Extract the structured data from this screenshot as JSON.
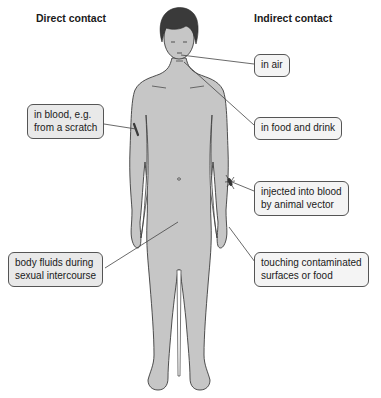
{
  "headings": {
    "direct": "Direct contact",
    "indirect": "Indirect contact"
  },
  "labels": {
    "in_air": {
      "lines": [
        "in air"
      ]
    },
    "food_drink": {
      "lines": [
        "in food and drink"
      ]
    },
    "blood_scratch": {
      "lines": [
        "in blood, e.g.",
        "from a scratch"
      ]
    },
    "animal_vector": {
      "lines": [
        "injected into blood",
        "by animal vector"
      ]
    },
    "touching": {
      "lines": [
        "touching contaminated",
        "surfaces or food"
      ]
    },
    "body_fluids": {
      "lines": [
        "body fluids during",
        "sexual intercourse"
      ]
    }
  },
  "colors": {
    "skin": "#c6c6c6",
    "outline": "#3c3c3c",
    "hair": "#3a3a3a",
    "box_border": "#555555",
    "leader_line": "#444444"
  },
  "icons": [
    "human-figure",
    "scratch-mark",
    "mosquito-icon"
  ]
}
